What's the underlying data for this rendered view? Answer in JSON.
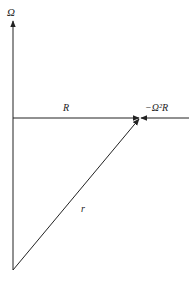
{
  "diagram": {
    "type": "vector-diagram",
    "labels": {
      "axis": "Ω",
      "horizontal_vector": "R",
      "force": "−Ω²R",
      "diagonal_vector": "r"
    },
    "colors": {
      "stroke": "#222222",
      "background": "#ffffff"
    },
    "geometry": {
      "origin": [
        13,
        270
      ],
      "axis_top": [
        13,
        20
      ],
      "horizontal_start": [
        13,
        118
      ],
      "vector_tip": [
        140,
        118
      ],
      "force_start": [
        189,
        118
      ]
    }
  }
}
